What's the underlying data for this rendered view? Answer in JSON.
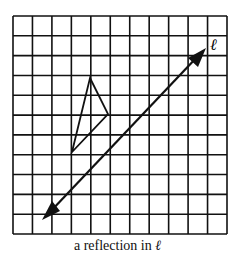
{
  "figure": {
    "caption": "a reflection in ",
    "line_label": "ℓ",
    "grid": {
      "columns": 11,
      "rows": 11
    },
    "triangle": {
      "vertices": [
        [
          4,
          3
        ],
        [
          5,
          5
        ],
        [
          3,
          7
        ]
      ]
    },
    "line": {
      "label": "ℓ",
      "from": [
        1.5,
        10.5
      ],
      "to": [
        10,
        2
      ]
    }
  }
}
